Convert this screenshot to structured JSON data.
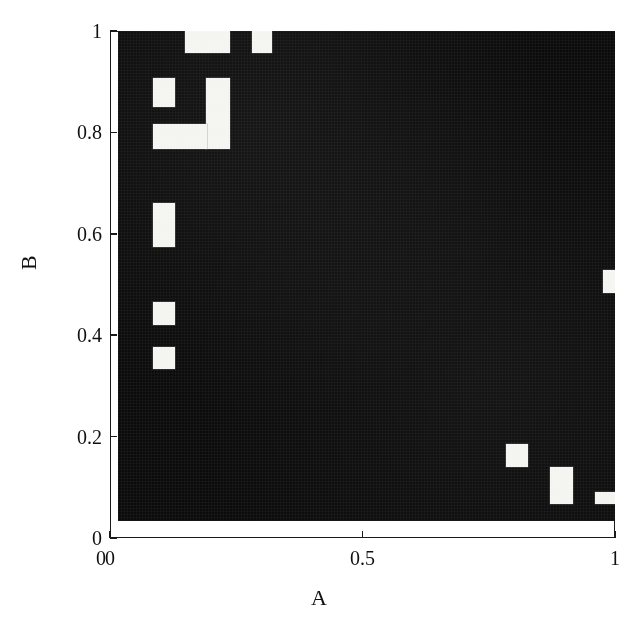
{
  "figure": {
    "type": "binary-raster-plot",
    "background_color": "#ffffff",
    "foreground_color": "#0b0b0b",
    "highlight_color": "#f4f4f0"
  },
  "axes": {
    "x": {
      "label": "A",
      "min": 0,
      "max": 1,
      "ticks": [
        {
          "value": 0,
          "label": "0"
        },
        {
          "value": 0.5,
          "label": "0.5"
        },
        {
          "value": 1,
          "label": "1"
        }
      ]
    },
    "y": {
      "label": "B",
      "min": 0,
      "max": 1,
      "ticks": [
        {
          "value": 0,
          "label": "0"
        },
        {
          "value": 0.2,
          "label": "0.2"
        },
        {
          "value": 0.4,
          "label": "0.4"
        },
        {
          "value": 0.6,
          "label": "0.6"
        },
        {
          "value": 0.8,
          "label": "0.8"
        },
        {
          "value": 1,
          "label": "1"
        }
      ]
    }
  },
  "chart_data": {
    "type": "heatmap",
    "title": "",
    "subtitle": "",
    "xlabel": "A",
    "ylabel": "B",
    "xlim": [
      0,
      1
    ],
    "ylim": [
      0,
      1
    ],
    "grid": false,
    "legend": null,
    "colormap": [
      "#0b0b0b",
      "#f4f4f0"
    ],
    "value_labels": {
      "0": "dark / black",
      "1": "light / white"
    },
    "cell_size": {
      "dx": 0.044,
      "dy": 0.044
    },
    "note": "Binary occupancy map over the unit square; value 1 (white) cells are listed as axis-aligned rectangles in data coordinates.",
    "white_regions": [
      {
        "id": "r1",
        "x0": 0.135,
        "x1": 0.225,
        "y0": 0.955,
        "y1": 1.0
      },
      {
        "id": "r2",
        "x0": 0.27,
        "x1": 0.31,
        "y0": 0.955,
        "y1": 1.0
      },
      {
        "id": "r3",
        "x0": 0.07,
        "x1": 0.115,
        "y0": 0.845,
        "y1": 0.905
      },
      {
        "id": "r4",
        "x0": 0.178,
        "x1": 0.225,
        "y0": 0.76,
        "y1": 0.905
      },
      {
        "id": "r5",
        "x0": 0.07,
        "x1": 0.18,
        "y0": 0.76,
        "y1": 0.81
      },
      {
        "id": "r6",
        "x0": 0.07,
        "x1": 0.115,
        "y0": 0.56,
        "y1": 0.65
      },
      {
        "id": "r7",
        "x0": 0.07,
        "x1": 0.115,
        "y0": 0.4,
        "y1": 0.447
      },
      {
        "id": "r8",
        "x0": 0.07,
        "x1": 0.115,
        "y0": 0.31,
        "y1": 0.355
      },
      {
        "id": "r9",
        "x0": 0.975,
        "x1": 1.0,
        "y0": 0.465,
        "y1": 0.513
      },
      {
        "id": "r10",
        "x0": 0.78,
        "x1": 0.825,
        "y0": 0.11,
        "y1": 0.158
      },
      {
        "id": "r11",
        "x0": 0.87,
        "x1": 0.915,
        "y0": 0.035,
        "y1": 0.11
      },
      {
        "id": "r12",
        "x0": 0.96,
        "x1": 1.0,
        "y0": 0.035,
        "y1": 0.06
      },
      {
        "id": "r13",
        "x0": 0.0,
        "x1": 1.0,
        "y0": 0.0,
        "y1": 0.035
      },
      {
        "id": "r14",
        "x0": 0.0,
        "x1": 0.02,
        "y0": 0.0,
        "y1": 1.0
      }
    ],
    "summary": {
      "fraction_white": 0.06,
      "fraction_black": 0.94,
      "n_white_regions": 12
    }
  }
}
